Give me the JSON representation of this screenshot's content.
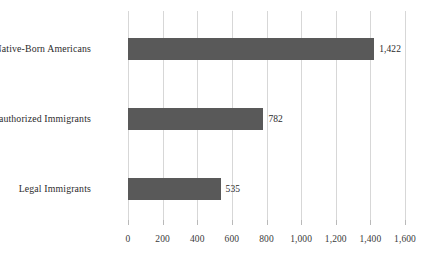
{
  "chart_data": {
    "type": "bar",
    "orientation": "horizontal",
    "title": "",
    "subtitle": "",
    "xlabel": "",
    "ylabel": "",
    "categories": [
      "Native-Born Americans",
      "Unauthorized Immigrants",
      "Legal Immigrants"
    ],
    "values": [
      1422,
      782,
      535
    ],
    "value_labels": [
      "1,422",
      "782",
      "535"
    ],
    "series": [
      {
        "name": "",
        "values": [
          1422,
          782,
          535
        ]
      }
    ],
    "xlim": [
      0,
      1600
    ],
    "xticks": [
      0,
      200,
      400,
      600,
      800,
      1000,
      1200,
      1400,
      1600
    ],
    "xtick_labels": [
      "0",
      "200",
      "400",
      "600",
      "800",
      "1,000",
      "1,200",
      "1,400",
      "1,600"
    ],
    "grid": true,
    "grid_axis": "x",
    "legend": false,
    "legend_position": "none",
    "bar_color": "#595959",
    "gridline_color": "#d7d7d7",
    "background_color": "#ffffff",
    "text_color": "#2b2b2b"
  }
}
